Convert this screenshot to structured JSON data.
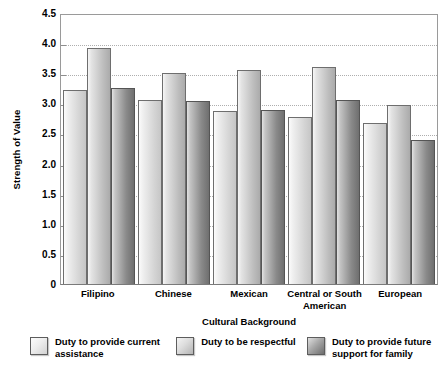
{
  "chart_data": {
    "type": "bar",
    "title": "",
    "xlabel": "Cultural Background",
    "ylabel": "Strength of Value",
    "ylim": [
      0,
      4.5
    ],
    "ytick_step": 0.5,
    "grid": true,
    "legend_position": "bottom",
    "categories": [
      "Filipino",
      "Chinese",
      "Mexican",
      "Central or South American",
      "European"
    ],
    "series": [
      {
        "name": "Duty to provide current assistance",
        "values": [
          3.22,
          3.06,
          2.88,
          2.78,
          2.67
        ]
      },
      {
        "name": "Duty to be respectful",
        "values": [
          3.92,
          3.5,
          3.55,
          3.6,
          2.97
        ]
      },
      {
        "name": "Duty to provide future support for family",
        "values": [
          3.25,
          3.04,
          2.89,
          3.05,
          2.39
        ]
      }
    ],
    "ytick_labels": [
      "4.5",
      "4.0",
      "3.5",
      "3.0",
      "2.5",
      "2.0",
      "1.5",
      "1.0",
      "0.5",
      "0"
    ],
    "colors": {
      "series_1": "#e9e9e9",
      "series_2": "#d0d0d0",
      "series_3": "#8b8b8b",
      "gridline": "#aeaeae",
      "axis": "#8d8d8d",
      "text": "#000000",
      "background": "#ffffff"
    }
  },
  "axes": {
    "y_title": "Strength of Value",
    "x_title": "Cultural Background"
  },
  "legend": {
    "items": [
      {
        "label": "Duty to provide current assistance"
      },
      {
        "label": "Duty to be respectful"
      },
      {
        "label": "Duty to provide future support for family"
      }
    ]
  }
}
